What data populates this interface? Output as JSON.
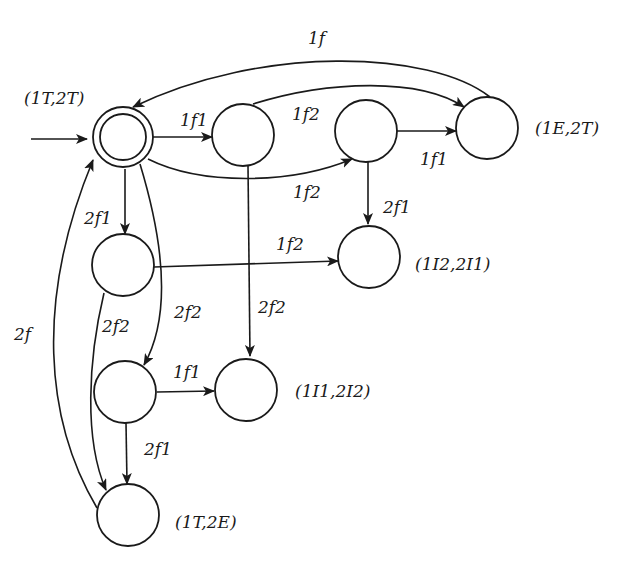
{
  "diagram": {
    "type": "state-transition-automaton",
    "states": {
      "initial": {
        "label": "(1T,2T)",
        "accepting": true
      },
      "a": {
        "label": ""
      },
      "b": {
        "label": ""
      },
      "e_t": {
        "label": "(1E,2T)"
      },
      "c": {
        "label": ""
      },
      "i2_i1": {
        "label": "(1I2,2I1)"
      },
      "d": {
        "label": ""
      },
      "i1_i2": {
        "label": "(1I1,2I2)"
      },
      "t_e": {
        "label": "(1T,2E)"
      }
    },
    "edges": {
      "init_a": {
        "from": "initial",
        "to": "a",
        "label": "1f1"
      },
      "a_etop": {
        "from": "a",
        "to": "e_t",
        "label": "1f2"
      },
      "init_b": {
        "from": "initial",
        "to": "b",
        "label": "1f2"
      },
      "b_et": {
        "from": "b",
        "to": "e_t",
        "label": "1f1"
      },
      "et_init": {
        "from": "e_t",
        "to": "initial",
        "label": "1f"
      },
      "b_i2i1": {
        "from": "b",
        "to": "i2_i1",
        "label": "2f1"
      },
      "init_c": {
        "from": "initial",
        "to": "c",
        "label": "2f1"
      },
      "c_i2i1": {
        "from": "c",
        "to": "i2_i1",
        "label": "1f2"
      },
      "a_i1i2": {
        "from": "a",
        "to": "i1_i2",
        "label": "2f2"
      },
      "init_d": {
        "from": "initial",
        "to": "d",
        "label": "2f2"
      },
      "c_te": {
        "from": "c",
        "to": "t_e",
        "label": "2f2"
      },
      "d_i1i2": {
        "from": "d",
        "to": "i1_i2",
        "label": "1f1"
      },
      "d_te": {
        "from": "d",
        "to": "t_e",
        "label": "2f1"
      },
      "te_init": {
        "from": "t_e",
        "to": "initial",
        "label": "2f"
      }
    }
  }
}
